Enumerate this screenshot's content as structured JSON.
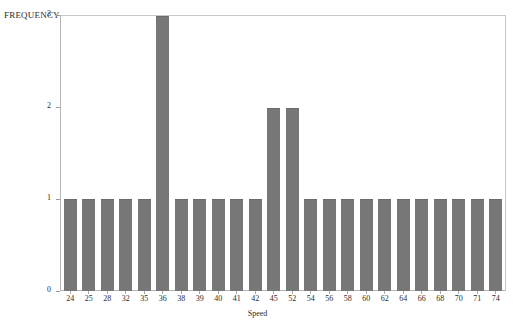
{
  "chart_data": {
    "type": "bar",
    "title": "",
    "xlabel": "Speed",
    "ylabel": "FREQUENCY",
    "categories": [
      "24",
      "25",
      "28",
      "32",
      "35",
      "36",
      "38",
      "39",
      "40",
      "41",
      "42",
      "45",
      "52",
      "54",
      "56",
      "58",
      "60",
      "62",
      "64",
      "66",
      "68",
      "70",
      "71",
      "74"
    ],
    "values": [
      1,
      1,
      1,
      1,
      1,
      3,
      1,
      1,
      1,
      1,
      1,
      2,
      2,
      1,
      1,
      1,
      1,
      1,
      1,
      1,
      1,
      1,
      1,
      1
    ],
    "ylim": [
      0,
      3
    ],
    "yticks": [
      0,
      1,
      2,
      3
    ],
    "ytick_labels": [
      "0",
      "1",
      "2",
      "3"
    ],
    "grid": false,
    "legend": null,
    "bar_color": "#777777",
    "frame_color": "#b4b4b4",
    "text_color": "#2b2b2b"
  },
  "axes": {
    "y_title": "FREQUENCY",
    "x_title": "Speed"
  }
}
